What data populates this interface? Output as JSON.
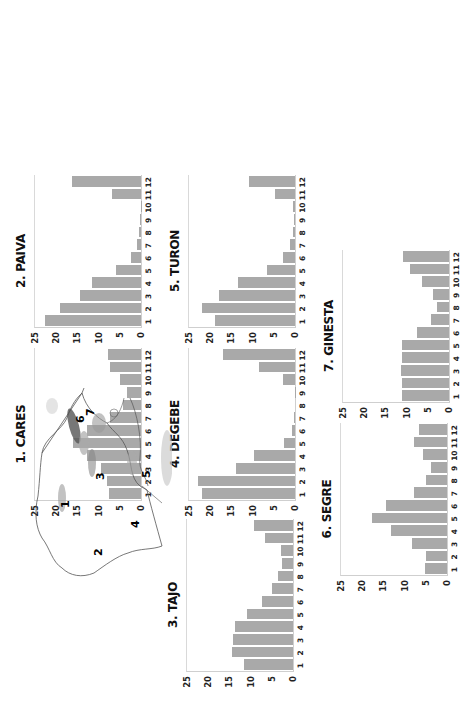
{
  "figure": {
    "orientation": "rotated -90 degrees (text reads bottom-to-top)",
    "map_labels": [
      "1",
      "2",
      "3",
      "4",
      "5",
      "6",
      "7"
    ]
  },
  "panels": [
    {
      "id": "cares",
      "title": "1. CARES"
    },
    {
      "id": "paiva",
      "title": "2. PAIVA"
    },
    {
      "id": "tajo",
      "title": "3. TAJO"
    },
    {
      "id": "degebe",
      "title": "4. DEGEBE"
    },
    {
      "id": "turon",
      "title": "5. TURON"
    },
    {
      "id": "segre",
      "title": "6. SEGRE"
    },
    {
      "id": "ginesta",
      "title": "7. GINESTA"
    }
  ],
  "axis": {
    "y_ticks": [
      "25",
      "20",
      "15",
      "10",
      "5",
      "0"
    ],
    "x_ticks": [
      "1",
      "2",
      "3",
      "4",
      "5",
      "6",
      "7",
      "8",
      "9",
      "10",
      "11",
      "12"
    ]
  },
  "chart_data": [
    {
      "type": "bar",
      "title": "1. CARES",
      "categories": [
        "1",
        "2",
        "3",
        "4",
        "5",
        "6",
        "7",
        "8",
        "9",
        "10",
        "11",
        "12"
      ],
      "values": [
        7.5,
        8.0,
        9.5,
        12.8,
        16.0,
        12.8,
        7.3,
        4.2,
        3.4,
        5.0,
        7.4,
        7.8
      ],
      "xlabel": "",
      "ylabel": "",
      "ylim": [
        0,
        25
      ],
      "grid": false
    },
    {
      "type": "bar",
      "title": "2. PAIVA",
      "categories": [
        "1",
        "2",
        "3",
        "4",
        "5",
        "6",
        "7",
        "8",
        "9",
        "10",
        "11",
        "12"
      ],
      "values": [
        22.7,
        19.2,
        14.5,
        11.5,
        6.0,
        2.3,
        0.9,
        0.4,
        0.2,
        0.1,
        6.9,
        16.3
      ],
      "xlabel": "",
      "ylabel": "",
      "ylim": [
        0,
        25
      ],
      "grid": false
    },
    {
      "type": "bar",
      "title": "3. TAJO",
      "categories": [
        "1",
        "2",
        "3",
        "4",
        "5",
        "6",
        "7",
        "8",
        "9",
        "10",
        "11",
        "12"
      ],
      "values": [
        11.5,
        14.4,
        14.2,
        13.6,
        10.8,
        7.4,
        5.0,
        3.6,
        2.7,
        2.9,
        6.6,
        9.2
      ],
      "xlabel": "",
      "ylabel": "",
      "ylim": [
        0,
        25
      ],
      "grid": false
    },
    {
      "type": "bar",
      "title": "4. DEGEBE",
      "categories": [
        "1",
        "2",
        "3",
        "4",
        "5",
        "6",
        "7",
        "8",
        "9",
        "10",
        "11",
        "12"
      ],
      "values": [
        22.0,
        22.8,
        14.0,
        9.6,
        2.7,
        0.7,
        0.2,
        0.0,
        0.1,
        2.8,
        8.4,
        17.0
      ],
      "xlabel": "",
      "ylabel": "",
      "ylim": [
        0,
        25
      ],
      "grid": false
    },
    {
      "type": "bar",
      "title": "5. TURON",
      "categories": [
        "1",
        "2",
        "3",
        "4",
        "5",
        "6",
        "7",
        "8",
        "9",
        "10",
        "11",
        "12"
      ],
      "values": [
        18.9,
        21.9,
        17.9,
        13.4,
        6.6,
        2.8,
        1.2,
        0.5,
        0.3,
        0.4,
        4.8,
        10.9
      ],
      "xlabel": "",
      "ylabel": "",
      "ylim": [
        0,
        25
      ],
      "grid": false
    },
    {
      "type": "bar",
      "title": "6. SEGRE",
      "categories": [
        "1",
        "2",
        "3",
        "4",
        "5",
        "6",
        "7",
        "8",
        "9",
        "10",
        "11",
        "12"
      ],
      "values": [
        5.2,
        5.0,
        8.3,
        13.3,
        17.7,
        14.3,
        7.8,
        5.0,
        3.7,
        5.7,
        7.9,
        6.5
      ],
      "xlabel": "",
      "ylabel": "",
      "ylim": [
        0,
        25
      ],
      "grid": false
    },
    {
      "type": "bar",
      "title": "7. GINESTA",
      "categories": [
        "1",
        "2",
        "3",
        "4",
        "5",
        "6",
        "7",
        "8",
        "9",
        "10",
        "11",
        "12"
      ],
      "values": [
        11.1,
        11.2,
        11.4,
        11.0,
        11.0,
        7.6,
        4.3,
        2.9,
        3.7,
        6.3,
        9.1,
        10.9
      ],
      "xlabel": "",
      "ylabel": "",
      "ylim": [
        0,
        25
      ],
      "grid": false
    }
  ],
  "layout": [
    {
      "panel": 1,
      "left": 14,
      "top": 350
    },
    {
      "panel": 0,
      "left": 14,
      "top": 523
    },
    {
      "panel": 4,
      "left": 168,
      "top": 350
    },
    {
      "panel": 3,
      "left": 168,
      "top": 523
    },
    {
      "panel": 2,
      "left": 166,
      "top": 694
    },
    {
      "panel": 6,
      "left": 322,
      "top": 425
    },
    {
      "panel": 5,
      "left": 320,
      "top": 598
    }
  ],
  "colors": {
    "bar": "#a9a9a9",
    "frame": "#cfcfcf",
    "text": "#222222"
  }
}
